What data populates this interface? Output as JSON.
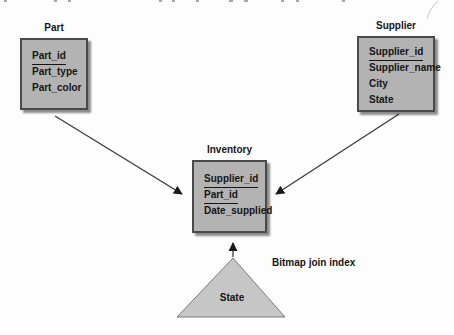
{
  "entities": {
    "part": {
      "title": "Part",
      "fields": [
        {
          "name": "Part_id",
          "key": true
        },
        {
          "name": "Part_type",
          "key": false
        },
        {
          "name": "Part_color",
          "key": false
        }
      ]
    },
    "supplier": {
      "title": "Supplier",
      "fields": [
        {
          "name": "Supplier_id",
          "key": true
        },
        {
          "name": "Supplier_name",
          "key": false
        },
        {
          "name": "City",
          "key": false
        },
        {
          "name": "State",
          "key": false
        }
      ]
    },
    "inventory": {
      "title": "Inventory",
      "fields": [
        {
          "name": "Supplier_id",
          "key": true
        },
        {
          "name": "Part_id",
          "key": true
        },
        {
          "name": "Date_supplied",
          "key": false
        }
      ]
    }
  },
  "index": {
    "shape": "triangle",
    "shape_label": "State",
    "annotation": "Bitmap join index"
  },
  "relationships": [
    {
      "from": "Part",
      "to": "Inventory"
    },
    {
      "from": "Supplier",
      "to": "Inventory"
    },
    {
      "from": "Bitmap join index",
      "to": "Inventory"
    }
  ],
  "colors": {
    "background": "#fdfdfd",
    "box_fill": "#b3b3b3",
    "box_border": "#4a4a4a",
    "box_shadow": "#777777",
    "triangle_fill": "#c6c6c6",
    "triangle_border": "#7d7d7d",
    "line": "#3a3a3a",
    "text": "#151515"
  }
}
